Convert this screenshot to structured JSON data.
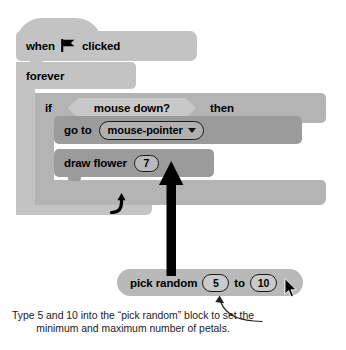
{
  "illustration": {
    "title": "Scratch script: draw flower with pick random petals",
    "colors": {
      "block_light": "#c3c3c3",
      "block_mid": "#b4b4b4",
      "block_dark": "#9b9b9b",
      "operator": "#b9b9b9",
      "hex_input": "#c8c8c8",
      "outline": "#1a1a1a",
      "ink": "#000000",
      "page": "#ffffff"
    }
  },
  "script": {
    "hat": {
      "word_when": "when",
      "flag_icon": "green-flag-icon",
      "word_clicked": "clicked"
    },
    "forever": {
      "label": "forever",
      "loop_icon": "loop-arrow-icon"
    },
    "if_block": {
      "label_if": "if",
      "condition": "mouse down?",
      "label_then": "then"
    },
    "go_to": {
      "label": "go to",
      "dropdown_value": "mouse-pointer",
      "dropdown_icon": "chevron-down-icon"
    },
    "draw_flower": {
      "label": "draw flower",
      "value": "7"
    }
  },
  "operator": {
    "pick_random": {
      "label_pick": "pick random",
      "min_value": "5",
      "label_to": "to",
      "max_value": "10"
    }
  },
  "annotations": {
    "drag_arrow": "drag-arrow-up-icon",
    "caption_arrow": "curved-callout-arrow-icon",
    "cursor": "mouse-pointer-cursor-icon",
    "caption": "Type 5 and 10 into the “pick random” block to set the minimum and maximum number of petals."
  }
}
